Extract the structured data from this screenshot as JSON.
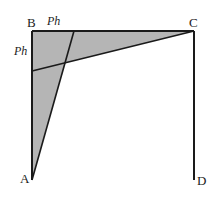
{
  "diagram": {
    "colors": {
      "fill": "#b5b5b5",
      "stroke": "#1a1a1a",
      "background": "#ffffff"
    },
    "points": {
      "A": {
        "label": "A",
        "x": 32,
        "y": 180
      },
      "B": {
        "label": "B",
        "x": 32,
        "y": 31
      },
      "C": {
        "label": "C",
        "x": 194,
        "y": 31
      },
      "D": {
        "label": "D",
        "x": 194,
        "y": 180
      },
      "P_top": {
        "x": 74,
        "y": 31
      },
      "P_left": {
        "x": 32,
        "y": 71
      },
      "intersection": {
        "x": 65,
        "y": 62
      }
    },
    "segment_labels": {
      "top": "Ph",
      "left": "Ph"
    },
    "shaded_regions": [
      "triangle A-B-P_top",
      "triangle B-C-P_left"
    ]
  }
}
